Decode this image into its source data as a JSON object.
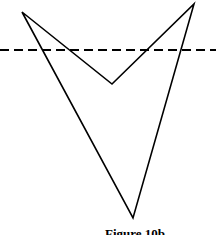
{
  "figure": {
    "caption": "Figure 10b",
    "stroke_color": "#000000",
    "background": "#ffffff",
    "polygon_points": "22,12 112,84 194,4 133,218",
    "dashed_line": {
      "x1": 0,
      "y1": 50,
      "x2": 216,
      "y2": 50,
      "dash": "9,5"
    }
  }
}
